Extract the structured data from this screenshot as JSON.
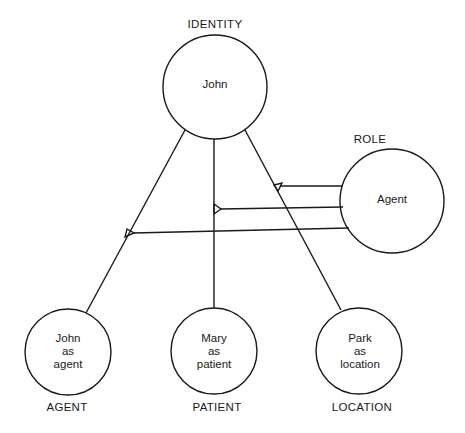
{
  "diagram": {
    "type": "semantic-network",
    "identity": {
      "heading": "IDENTITY",
      "text": "John"
    },
    "role": {
      "heading": "ROLE",
      "text": "Agent"
    },
    "cases": [
      {
        "heading": "AGENT",
        "text": "John\nas\nagent"
      },
      {
        "heading": "PATIENT",
        "text": "Mary\nas\npatient"
      },
      {
        "heading": "LOCATION",
        "text": "Park\nas\nlocation"
      }
    ],
    "edges": [
      {
        "from": "John",
        "to": "John as agent"
      },
      {
        "from": "John",
        "to": "Mary as patient"
      },
      {
        "from": "John",
        "to": "Park as location"
      },
      {
        "from": "Agent",
        "to": "John-Agent link"
      },
      {
        "from": "Agent",
        "to": "John-Patient link"
      },
      {
        "from": "Agent",
        "to": "John-Location link"
      }
    ],
    "colors": {
      "stroke": "#1a1a1a",
      "background": "#ffffff"
    }
  }
}
